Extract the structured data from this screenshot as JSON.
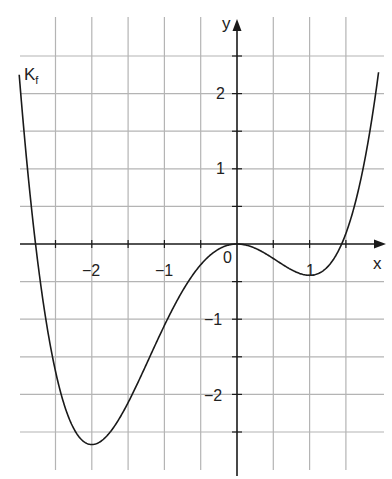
{
  "chart_data": {
    "type": "line",
    "title": "",
    "xlabel": "x",
    "ylabel": "y",
    "curve_label": "K",
    "curve_label_sub": "f",
    "function": "f(x) = 0.25x^4 + (1/3)x^3 - x^2",
    "xlim": [
      -3.0,
      2.0
    ],
    "ylim": [
      -3.0,
      3.0
    ],
    "grid": true,
    "grid_step": 0.5,
    "x_ticks": [
      -2,
      -1,
      0,
      1
    ],
    "x_tick_labels": [
      "−2",
      "−1",
      "0",
      "1"
    ],
    "y_ticks": [
      2,
      1,
      -1,
      -2
    ],
    "y_tick_labels": [
      "2",
      "1",
      "−1",
      "−2"
    ],
    "key_points": [
      {
        "x": -2,
        "y": -2.67,
        "kind": "local minimum"
      },
      {
        "x": 0,
        "y": 0,
        "kind": "local maximum"
      },
      {
        "x": 1,
        "y": -0.42,
        "kind": "local minimum"
      },
      {
        "x": 1.43,
        "y": 0,
        "kind": "root"
      },
      {
        "x": -2.76,
        "y": 0,
        "kind": "root"
      }
    ],
    "series": [
      {
        "name": "K_f",
        "x": [
          -3.0,
          -2.75,
          -2.5,
          -2.25,
          -2.0,
          -1.75,
          -1.5,
          -1.25,
          -1.0,
          -0.75,
          -0.5,
          -0.25,
          0.0,
          0.25,
          0.5,
          0.75,
          1.0,
          1.25,
          1.5,
          1.75,
          1.95
        ],
        "y": [
          2.25,
          -0.04,
          -1.72,
          -2.55,
          -2.67,
          -2.29,
          -1.64,
          -0.95,
          -0.42,
          -0.13,
          -0.23,
          -0.06,
          0.0,
          -0.06,
          -0.19,
          -0.34,
          -0.42,
          -0.26,
          0.27,
          1.34,
          2.68
        ]
      }
    ]
  },
  "labels": {
    "x_axis": "x",
    "y_axis": "y",
    "curve": "K",
    "curve_sub": "f",
    "x_ticks": [
      "−2",
      "−1",
      "0",
      "1"
    ],
    "y_ticks": [
      "2",
      "1",
      "−1",
      "−2"
    ]
  }
}
